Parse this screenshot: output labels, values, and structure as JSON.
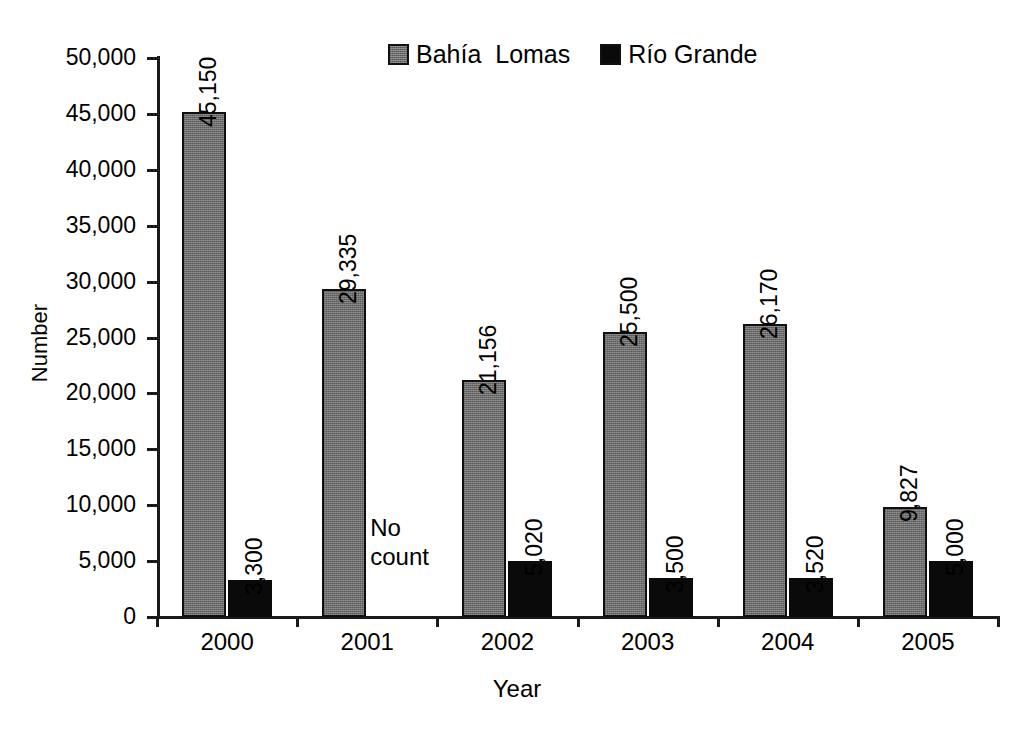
{
  "chart_data": {
    "type": "bar",
    "title": "",
    "xlabel": "Year",
    "ylabel": "Number",
    "categories": [
      "2000",
      "2001",
      "2002",
      "2003",
      "2004",
      "2005"
    ],
    "ylim": [
      0,
      50000
    ],
    "ytick_values": [
      0,
      5000,
      10000,
      15000,
      20000,
      25000,
      30000,
      35000,
      40000,
      45000,
      50000
    ],
    "ytick_labels": [
      "0",
      "5,000",
      "10,000",
      "15,000",
      "20,000",
      "25,000",
      "30,000",
      "35,000",
      "40,000",
      "45,000",
      "50,000"
    ],
    "grid": false,
    "legend_position": "top-center",
    "series": [
      {
        "name": "Bahía Lomas",
        "color": "#6e6e6e",
        "values": [
          45150,
          29335,
          21156,
          25500,
          26170,
          9827
        ],
        "data_labels": [
          "45,150",
          "29,335",
          "21,156",
          "25,500",
          "26,170",
          "9,827"
        ]
      },
      {
        "name": "Río Grande",
        "color": "#0a0a0a",
        "values": [
          3300,
          null,
          5020,
          3500,
          3520,
          5000
        ],
        "data_labels": [
          "3,300",
          "",
          "5,020",
          "3,500",
          "3,520",
          "5,000"
        ]
      }
    ],
    "annotations": [
      {
        "text": "No count",
        "category": "2001",
        "series": "Río Grande"
      }
    ]
  },
  "legend": {
    "items": [
      {
        "label": "Bahía  Lomas",
        "swatch": "gray"
      },
      {
        "label": "Río Grande",
        "swatch": "black"
      }
    ]
  },
  "annotation_no_count": {
    "line1": "No",
    "line2": "count"
  }
}
